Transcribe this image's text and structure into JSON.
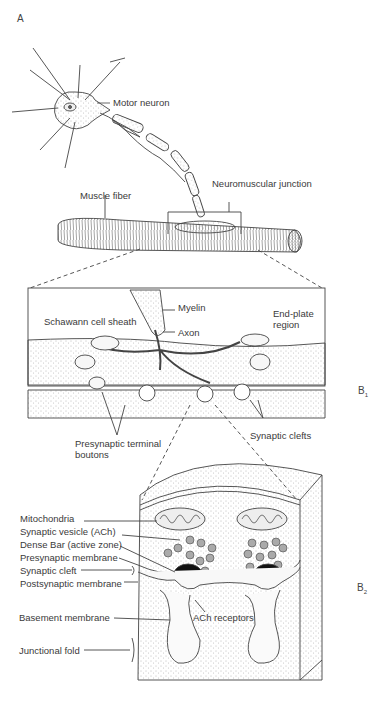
{
  "figure": {
    "panels": {
      "a": "A",
      "b1": "B",
      "b1_sub": "1",
      "b2": "B",
      "b2_sub": "2"
    },
    "panel_a": {
      "labels": {
        "motor_neuron": "Motor neuron",
        "muscle_fiber": "Muscle fiber",
        "neuromuscular_junction": "Neuromuscular junction"
      }
    },
    "panel_b1": {
      "labels": {
        "myelin": "Myelin",
        "schwann_cell_sheath": "Schawann cell sheath",
        "axon": "Axon",
        "end_plate_region_1": "End-plate",
        "end_plate_region_2": "region",
        "presynaptic_terminal_boutons_1": "Presynaptic terminal",
        "presynaptic_terminal_boutons_2": "boutons",
        "synaptic_clefts": "Synaptic clefts"
      }
    },
    "panel_b2": {
      "labels": {
        "mitochondria": "Mitochondria",
        "synaptic_vesicle": "Synaptic vesicle (ACh)",
        "dense_bar": "Dense Bar (active zone)",
        "presynaptic_membrane": "Presynaptic membrane",
        "synaptic_cleft": "Synaptic cleft",
        "postsynaptic_membrane": "Postsynaptic membrane",
        "basement_membrane": "Basement membrane",
        "ach_receptors": "ACh receptors",
        "junctional_fold": "Junctional fold"
      }
    }
  }
}
